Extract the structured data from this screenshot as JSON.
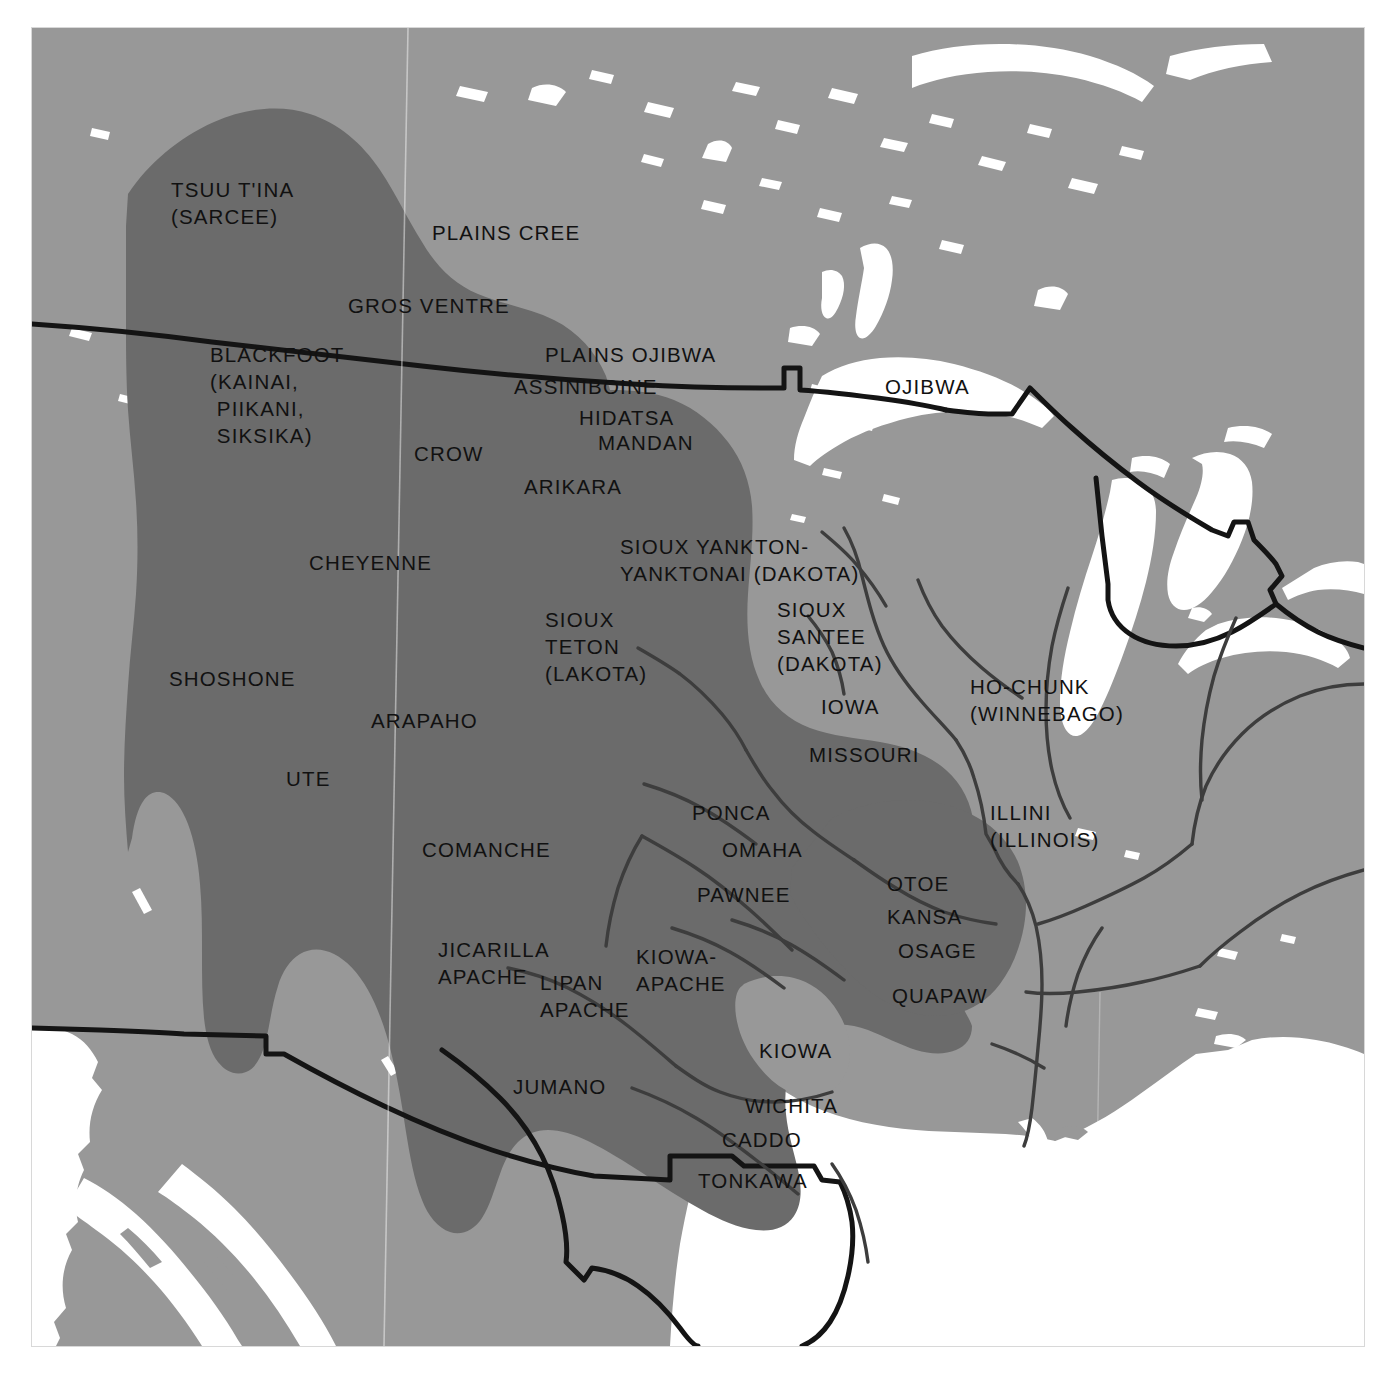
{
  "map": {
    "title": "Plains Indian Tribal Territories",
    "frame": {
      "x": 32,
      "y": 28,
      "width": 1332,
      "height": 1318
    },
    "colors": {
      "water": "#ffffff",
      "land": "#989898",
      "plains_culture_area": "#6b6b6b",
      "national_border": "#141414",
      "river": "#3d3d3d",
      "label_text": "#111111",
      "page_background": "#ffffff",
      "frame_edge": "#d8d8d8"
    },
    "legend_note": "Darker shaded region denotes the Plains culture area; thick black lines are national borders; thin grey lines are rivers.",
    "labels": [
      {
        "id": "tsuu-tina",
        "text": "TSUU T'INA\n(SARCEE)",
        "x": 139,
        "y": 148,
        "align": "l"
      },
      {
        "id": "plains-cree",
        "text": "PLAINS CREE",
        "x": 400,
        "y": 191,
        "align": "l"
      },
      {
        "id": "gros-ventre",
        "text": "GROS VENTRE",
        "x": 316,
        "y": 264,
        "align": "l"
      },
      {
        "id": "plains-ojibwa",
        "text": "PLAINS OJIBWA",
        "x": 513,
        "y": 313,
        "align": "l"
      },
      {
        "id": "blackfoot",
        "text": "BLACKFOOT\n(KAINAI,\n PIIKANI,\n SIKSIKA)",
        "x": 178,
        "y": 313,
        "align": "l"
      },
      {
        "id": "assiniboine",
        "text": "ASSINIBOINE",
        "x": 482,
        "y": 345,
        "align": "l"
      },
      {
        "id": "ojibwa",
        "text": "OJIBWA",
        "x": 853,
        "y": 345,
        "align": "l"
      },
      {
        "id": "hidatsa",
        "text": "HIDATSA",
        "x": 547,
        "y": 376,
        "align": "l"
      },
      {
        "id": "mandan",
        "text": "MANDAN",
        "x": 566,
        "y": 401,
        "align": "l"
      },
      {
        "id": "crow",
        "text": "CROW",
        "x": 382,
        "y": 412,
        "align": "l"
      },
      {
        "id": "arikara",
        "text": "ARIKARA",
        "x": 492,
        "y": 445,
        "align": "l"
      },
      {
        "id": "sioux-yankton",
        "text": "SIOUX YANKTON-\nYANKTONAI (DAKOTA)",
        "x": 588,
        "y": 505,
        "align": "l"
      },
      {
        "id": "cheyenne",
        "text": "CHEYENNE",
        "x": 277,
        "y": 521,
        "align": "l"
      },
      {
        "id": "sioux-santee",
        "text": "SIOUX\nSANTEE\n(DAKOTA)",
        "x": 745,
        "y": 568,
        "align": "l"
      },
      {
        "id": "sioux-teton",
        "text": "SIOUX\nTETON\n(LAKOTA)",
        "x": 513,
        "y": 578,
        "align": "l"
      },
      {
        "id": "shoshone",
        "text": "SHOSHONE",
        "x": 137,
        "y": 637,
        "align": "l"
      },
      {
        "id": "ho-chunk",
        "text": "HO-CHUNK\n(WINNEBAGO)",
        "x": 938,
        "y": 645,
        "align": "l"
      },
      {
        "id": "iowa",
        "text": "IOWA",
        "x": 789,
        "y": 665,
        "align": "l"
      },
      {
        "id": "arapaho",
        "text": "ARAPAHO",
        "x": 339,
        "y": 679,
        "align": "l"
      },
      {
        "id": "missouri",
        "text": "MISSOURI",
        "x": 777,
        "y": 713,
        "align": "l"
      },
      {
        "id": "ute",
        "text": "UTE",
        "x": 254,
        "y": 737,
        "align": "l"
      },
      {
        "id": "ponca",
        "text": "PONCA",
        "x": 660,
        "y": 771,
        "align": "l"
      },
      {
        "id": "illini",
        "text": "ILLINI\n(ILLINOIS)",
        "x": 958,
        "y": 771,
        "align": "l"
      },
      {
        "id": "omaha",
        "text": "OMAHA",
        "x": 690,
        "y": 808,
        "align": "l"
      },
      {
        "id": "comanche",
        "text": "COMANCHE",
        "x": 390,
        "y": 808,
        "align": "l"
      },
      {
        "id": "otoe",
        "text": "OTOE",
        "x": 855,
        "y": 842,
        "align": "l"
      },
      {
        "id": "pawnee",
        "text": "PAWNEE",
        "x": 665,
        "y": 853,
        "align": "l"
      },
      {
        "id": "kansa",
        "text": "KANSA",
        "x": 855,
        "y": 875,
        "align": "l"
      },
      {
        "id": "jicarilla-apache",
        "text": "JICARILLA\nAPACHE",
        "x": 406,
        "y": 908,
        "align": "l"
      },
      {
        "id": "osage",
        "text": "OSAGE",
        "x": 866,
        "y": 909,
        "align": "l"
      },
      {
        "id": "kiowa-apache",
        "text": "KIOWA-\nAPACHE",
        "x": 604,
        "y": 915,
        "align": "l"
      },
      {
        "id": "lipan-apache",
        "text": "LIPAN\nAPACHE",
        "x": 508,
        "y": 941,
        "align": "l"
      },
      {
        "id": "quapaw",
        "text": "QUAPAW",
        "x": 860,
        "y": 954,
        "align": "l"
      },
      {
        "id": "kiowa",
        "text": "KIOWA",
        "x": 727,
        "y": 1009,
        "align": "l"
      },
      {
        "id": "jumano",
        "text": "JUMANO",
        "x": 481,
        "y": 1045,
        "align": "l"
      },
      {
        "id": "wichita",
        "text": "WICHITA",
        "x": 713,
        "y": 1064,
        "align": "l"
      },
      {
        "id": "caddo",
        "text": "CADDO",
        "x": 690,
        "y": 1098,
        "align": "l"
      },
      {
        "id": "tonkawa",
        "text": "TONKAWA",
        "x": 666,
        "y": 1139,
        "align": "l"
      }
    ]
  }
}
